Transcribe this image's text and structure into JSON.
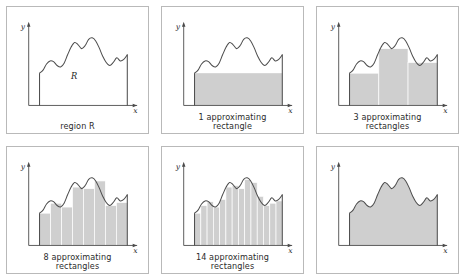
{
  "figure": {
    "background": "#ffffff",
    "panel_border_color": "#b9b9b9",
    "curve_color": "#4d4d4d",
    "axis_color": "#4a4a4a",
    "fill_color": "#cfcfcf",
    "rect_edge_color": "#ffffff"
  },
  "panels": [
    {
      "id": "region-r",
      "caption_line1": "region R",
      "caption_line2": "",
      "x_axis_label": "x",
      "y_axis_label": "y",
      "region_label": "R",
      "rect_count": 0,
      "filled": false
    },
    {
      "id": "one-rectangle",
      "caption_line1": "1 approximating",
      "caption_line2": "rectangle",
      "x_axis_label": "x",
      "y_axis_label": "y",
      "region_label": "",
      "rect_count": 1,
      "filled": true
    },
    {
      "id": "three-rectangles",
      "caption_line1": "3 approximating",
      "caption_line2": "rectangles",
      "x_axis_label": "x",
      "y_axis_label": "y",
      "region_label": "",
      "rect_count": 3,
      "filled": true
    },
    {
      "id": "eight-rectangles",
      "caption_line1": "8 approximating",
      "caption_line2": "rectangles",
      "x_axis_label": "x",
      "y_axis_label": "y",
      "region_label": "",
      "rect_count": 8,
      "filled": true
    },
    {
      "id": "fourteen-rectangles",
      "caption_line1": "14 approximating",
      "caption_line2": "rectangles",
      "x_axis_label": "x",
      "y_axis_label": "y",
      "region_label": "",
      "rect_count": 14,
      "filled": true
    },
    {
      "id": "exact-region",
      "caption_line1": "",
      "caption_line2": "",
      "x_axis_label": "x",
      "y_axis_label": "y",
      "region_label": "",
      "rect_count": 0,
      "filled": true
    }
  ],
  "chart_data": {
    "type": "area",
    "xlabel": "x",
    "ylabel": "y",
    "xlim": [
      0,
      1
    ],
    "ylim": [
      0,
      1
    ],
    "grid": false,
    "legend": null,
    "curve_samples_x": [
      0.0,
      0.04,
      0.08,
      0.12,
      0.16,
      0.2,
      0.24,
      0.28,
      0.32,
      0.36,
      0.4,
      0.44,
      0.48,
      0.52,
      0.56,
      0.6,
      0.64,
      0.68,
      0.72,
      0.76,
      0.8,
      0.84,
      0.88,
      0.92,
      0.96,
      1.0
    ],
    "curve_samples_y": [
      0.42,
      0.46,
      0.54,
      0.58,
      0.57,
      0.52,
      0.5,
      0.55,
      0.66,
      0.76,
      0.82,
      0.79,
      0.74,
      0.78,
      0.86,
      0.88,
      0.84,
      0.75,
      0.64,
      0.56,
      0.52,
      0.56,
      0.62,
      0.58,
      0.6,
      0.66
    ],
    "rect_heights": {
      "1": [
        0.42
      ],
      "3": [
        0.42,
        0.74,
        0.56
      ],
      "8": [
        0.42,
        0.55,
        0.5,
        0.76,
        0.74,
        0.84,
        0.52,
        0.56
      ],
      "14": [
        0.42,
        0.52,
        0.57,
        0.5,
        0.6,
        0.76,
        0.78,
        0.74,
        0.86,
        0.82,
        0.64,
        0.52,
        0.55,
        0.58
      ]
    }
  }
}
